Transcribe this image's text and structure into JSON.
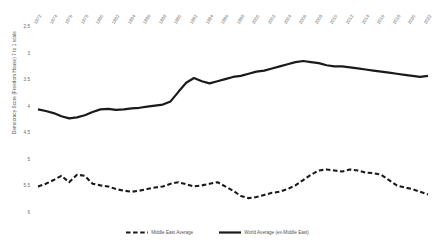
{
  "chart_data": {
    "type": "line",
    "title": "",
    "xlabel": "",
    "ylabel": "Democracy Score (Freedom House) 7 to 1 scale",
    "ylim": [
      6,
      2.5
    ],
    "y_inverted": true,
    "ytick_labels": [
      "2.5",
      "3",
      "3.5",
      "4",
      "4.5",
      "5",
      "5.5",
      "6"
    ],
    "ytick_values": [
      2.5,
      3,
      3.5,
      4,
      4.5,
      5,
      5.5,
      6
    ],
    "grid": false,
    "legend_position": "bottom",
    "categories": [
      1972,
      1973,
      1974,
      1975,
      1976,
      1977,
      1978,
      1979,
      1980,
      1981,
      1982,
      1983,
      1984,
      1985,
      1986,
      1987,
      1988,
      1989,
      1990,
      1991,
      1992,
      1993,
      1994,
      1995,
      1996,
      1997,
      1998,
      1999,
      2000,
      2001,
      2002,
      2003,
      2004,
      2005,
      2006,
      2007,
      2008,
      2009,
      2010,
      2011,
      2012,
      2013,
      2014,
      2015,
      2016,
      2017,
      2018,
      2019,
      2020,
      2021,
      2022
    ],
    "xtick_labels": [
      "1972",
      "1974",
      "1976",
      "1978",
      "1980",
      "1982",
      "1984",
      "1986",
      "1988",
      "1990",
      "1992",
      "1994",
      "1996",
      "1998",
      "2000",
      "2002",
      "2004",
      "2006",
      "2008",
      "2010",
      "2012",
      "2014",
      "2016",
      "2018",
      "2020",
      "2022"
    ],
    "series": [
      {
        "name": "Middle East Average",
        "style": "dashed",
        "color": "#1a1a1a",
        "values": [
          5.5,
          5.45,
          5.38,
          5.3,
          5.42,
          5.28,
          5.3,
          5.45,
          5.48,
          5.5,
          5.55,
          5.58,
          5.6,
          5.58,
          5.55,
          5.52,
          5.5,
          5.45,
          5.42,
          5.46,
          5.5,
          5.48,
          5.45,
          5.42,
          5.5,
          5.58,
          5.68,
          5.72,
          5.7,
          5.66,
          5.62,
          5.6,
          5.55,
          5.48,
          5.38,
          5.28,
          5.2,
          5.18,
          5.2,
          5.22,
          5.18,
          5.2,
          5.24,
          5.25,
          5.28,
          5.38,
          5.48,
          5.52,
          5.55,
          5.6,
          5.65
        ]
      },
      {
        "name": "World Average (ex-Middle East)",
        "style": "solid",
        "color": "#1a1a1a",
        "values": [
          4.05,
          4.08,
          4.12,
          4.18,
          4.22,
          4.2,
          4.16,
          4.1,
          4.05,
          4.04,
          4.06,
          4.05,
          4.03,
          4.02,
          4.0,
          3.98,
          3.96,
          3.9,
          3.72,
          3.55,
          3.46,
          3.52,
          3.56,
          3.52,
          3.48,
          3.44,
          3.42,
          3.38,
          3.34,
          3.32,
          3.28,
          3.24,
          3.2,
          3.16,
          3.14,
          3.16,
          3.18,
          3.22,
          3.24,
          3.24,
          3.26,
          3.28,
          3.3,
          3.32,
          3.34,
          3.36,
          3.38,
          3.4,
          3.42,
          3.44,
          3.42
        ]
      }
    ]
  },
  "legend": {
    "items": [
      {
        "label": "Middle East Average",
        "style": "dashed"
      },
      {
        "label": "World Average (ex-Middle East)",
        "style": "solid"
      }
    ]
  }
}
